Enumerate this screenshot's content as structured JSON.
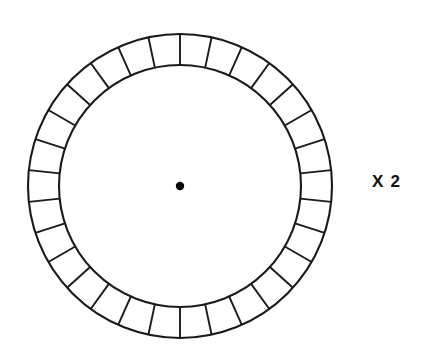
{
  "canvas": {
    "width": 428,
    "height": 362,
    "background": "#ffffff"
  },
  "annotation": {
    "multiplier_label": "X 2"
  },
  "wheel": {
    "name": "segmented-ring-wheel",
    "center_x": 180,
    "center_y": 186,
    "outer_radius": 152,
    "inner_radius": 121,
    "segment_count": 30,
    "spoke_start_angle_deg": -90,
    "stroke_color": "#1a1a1a",
    "stroke_width": 2.1,
    "fill_color": "#ffffff"
  },
  "hub": {
    "name": "center-dot",
    "center_x": 180,
    "center_y": 186,
    "radius": 4.2,
    "color": "#000000"
  },
  "chart_data": {
    "type": "pie",
    "title": "",
    "subtitle": "",
    "xlabel": "",
    "ylabel": "",
    "grid": false,
    "legend_position": "none",
    "categories": [
      "seg-01",
      "seg-02",
      "seg-03",
      "seg-04",
      "seg-05",
      "seg-06",
      "seg-07",
      "seg-08",
      "seg-09",
      "seg-10",
      "seg-11",
      "seg-12",
      "seg-13",
      "seg-14",
      "seg-15",
      "seg-16",
      "seg-17",
      "seg-18",
      "seg-19",
      "seg-20",
      "seg-21",
      "seg-22",
      "seg-23",
      "seg-24",
      "seg-25",
      "seg-26",
      "seg-27",
      "seg-28",
      "seg-29",
      "seg-30"
    ],
    "values": [
      12,
      12,
      12,
      12,
      12,
      12,
      12,
      12,
      12,
      12,
      12,
      12,
      12,
      12,
      12,
      12,
      12,
      12,
      12,
      12,
      12,
      12,
      12,
      12,
      12,
      12,
      12,
      12,
      12,
      12
    ],
    "value_unit": "degrees",
    "annotations": [
      "X 2"
    ]
  }
}
